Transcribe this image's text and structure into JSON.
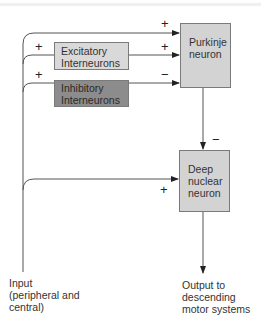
{
  "diagram": {
    "nodes": {
      "excitatory": {
        "line1": "Excitatory",
        "line2": "Interneurons"
      },
      "inhibitory": {
        "line1": "Inhibitory",
        "line2": "Interneurons"
      },
      "purkinje": {
        "line1": "Purkinje",
        "line2": "neuron"
      },
      "deep_nuclear": {
        "line1": "Deep",
        "line2": "nuclear",
        "line3": "neuron"
      }
    },
    "signs": {
      "input_to_purkinje": "+",
      "input_to_excitatory": "+",
      "input_to_inhibitory": "+",
      "excitatory_to_purkinje": "+",
      "inhibitory_to_purkinje": "−",
      "purkinje_to_deep": "−",
      "input_to_deep": "+"
    },
    "input_label": {
      "line1": "Input",
      "line2": "(peripheral and",
      "line3": "central)"
    },
    "output_label": {
      "line1": "Output to",
      "line2": "descending",
      "line3": "motor systems"
    },
    "colors": {
      "light_box": "#d9d9d9",
      "dark_box": "#8c8c8c",
      "line": "#444444"
    }
  }
}
